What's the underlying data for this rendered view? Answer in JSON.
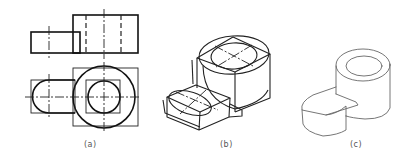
{
  "figure": {
    "panels": [
      {
        "id": "a",
        "label": "(a)",
        "content": "Orthographic front and top views"
      },
      {
        "id": "b",
        "label": "(b)",
        "content": "Isometric construction sketch with boxes and ellipses"
      },
      {
        "id": "c",
        "label": "(c)",
        "content": "Finished pictorial sketch"
      }
    ]
  },
  "colors": {
    "line": "#111111",
    "label": "#555555",
    "background": "#ffffff"
  }
}
